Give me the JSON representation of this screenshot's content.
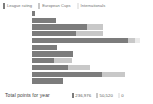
{
  "colors": {
    "series1": "#7c7c7c",
    "series2": "#c8c8c8",
    "series3": "#eaeaea",
    "background": "#ffffff",
    "text": "#6e6e6e",
    "footer_text": "#3f3f3f"
  },
  "legend": {
    "position": "top-left",
    "items": [
      {
        "label": "League rating",
        "color": "#7c7c7c",
        "swatch": "legend-swatch-league-rating"
      },
      {
        "label": "European Cups",
        "color": "#c8c8c8",
        "swatch": "legend-swatch-european-cups"
      },
      {
        "label": "Internationals",
        "color": "#eaeaea",
        "swatch": "legend-swatch-internationals"
      }
    ]
  },
  "footer": {
    "label": "Total points for year",
    "totals": [
      {
        "value": "236,976",
        "color": "#7c7c7c"
      },
      {
        "value": "50,520",
        "color": "#c8c8c8"
      },
      {
        "value": "0",
        "color": "#eaeaea"
      }
    ]
  },
  "chart_data": {
    "type": "bar",
    "orientation": "horizontal",
    "stacked": true,
    "title": "",
    "xlabel": "",
    "ylabel": "",
    "grid": false,
    "legend_position": "top-left",
    "categories": [
      "1",
      "2",
      "3",
      "4",
      "5",
      "6",
      "7",
      "8",
      "9",
      "10",
      "11"
    ],
    "series": [
      {
        "name": "League rating",
        "color": "#7c7c7c",
        "values": [
          3,
          24,
          55,
          44,
          96,
          25,
          41,
          22,
          36,
          70,
          31
        ]
      },
      {
        "name": "European Cups",
        "color": "#c8c8c8",
        "values": [
          0,
          0,
          16,
          27,
          7,
          0,
          0,
          18,
          22,
          23,
          0
        ]
      },
      {
        "name": "Internationals",
        "color": "#eaeaea",
        "values": [
          0,
          0,
          0,
          0,
          5,
          0,
          0,
          0,
          0,
          0,
          0
        ]
      }
    ],
    "xlim": [
      0,
      121
    ],
    "bars": [
      {
        "segments": [
          {
            "series": "League rating",
            "width": 3,
            "color": "#7c7c7c"
          }
        ]
      },
      {
        "segments": [
          {
            "series": "League rating",
            "width": 24,
            "color": "#7c7c7c"
          }
        ]
      },
      {
        "segments": [
          {
            "series": "League rating",
            "width": 55,
            "color": "#7c7c7c"
          },
          {
            "series": "European Cups",
            "width": 16,
            "color": "#c8c8c8"
          }
        ]
      },
      {
        "segments": [
          {
            "series": "League rating",
            "width": 44,
            "color": "#7c7c7c"
          },
          {
            "series": "European Cups",
            "width": 27,
            "color": "#c8c8c8"
          }
        ]
      },
      {
        "segments": [
          {
            "series": "League rating",
            "width": 96,
            "color": "#7c7c7c"
          },
          {
            "series": "European Cups",
            "width": 7,
            "color": "#c8c8c8"
          },
          {
            "series": "Internationals",
            "width": 5,
            "color": "#eaeaea"
          }
        ]
      },
      {
        "segments": [
          {
            "series": "League rating",
            "width": 25,
            "color": "#7c7c7c"
          }
        ]
      },
      {
        "segments": [
          {
            "series": "League rating",
            "width": 41,
            "color": "#7c7c7c"
          }
        ]
      },
      {
        "segments": [
          {
            "series": "League rating",
            "width": 22,
            "color": "#7c7c7c"
          },
          {
            "series": "European Cups",
            "width": 18,
            "color": "#c8c8c8"
          }
        ]
      },
      {
        "segments": [
          {
            "series": "League rating",
            "width": 36,
            "color": "#7c7c7c"
          },
          {
            "series": "European Cups",
            "width": 22,
            "color": "#c8c8c8"
          }
        ]
      },
      {
        "segments": [
          {
            "series": "League rating",
            "width": 70,
            "color": "#7c7c7c"
          },
          {
            "series": "European Cups",
            "width": 23,
            "color": "#c8c8c8"
          }
        ]
      },
      {
        "segments": [
          {
            "series": "League rating",
            "width": 31,
            "color": "#7c7c7c"
          }
        ]
      }
    ]
  }
}
